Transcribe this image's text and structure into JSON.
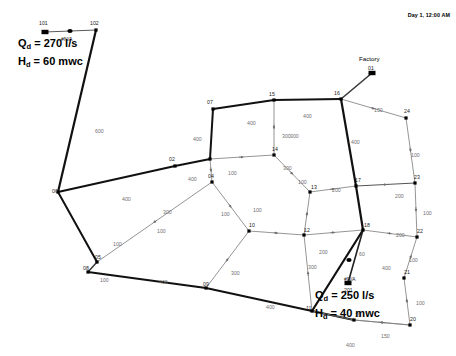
{
  "window": {
    "title": "Water Distribution Network Map",
    "background": "#ffffff"
  },
  "header": {
    "timestamp": "Day 1, 12:00 AM"
  },
  "annotations": {
    "source": {
      "flow_label": "Q",
      "flow_sub": "d",
      "flow_value": " = 270 l/s",
      "head_label": "H",
      "head_sub": "d",
      "head_value": " = 60 mwc",
      "na": "#N/A"
    },
    "factory": {
      "title": "Factory",
      "flow_label": "Q",
      "flow_sub": "d",
      "flow_value": " = 250 l/s",
      "head_label": "H",
      "head_sub": "d",
      "head_value": " = 40 mwc",
      "na": "#N/A",
      "pump_id": "201"
    }
  },
  "colors": {
    "pipe_thin": "#595959",
    "pipe_thick": "#111111",
    "node": "#000000",
    "length_text": "#6f6f6f",
    "node_text": "#1a1a1a"
  },
  "chart_data": {
    "type": "diagram",
    "nodes": [
      {
        "id": "101",
        "label": "101",
        "x": 45,
        "y": 32,
        "kind": "reservoir"
      },
      {
        "id": "102",
        "label": "102",
        "x": 96,
        "y": 30,
        "kind": "junction"
      },
      {
        "id": "v100",
        "label": "#N/A",
        "x": 70,
        "y": 31,
        "kind": "pump"
      },
      {
        "id": "06",
        "label": "06",
        "x": 58,
        "y": 192,
        "kind": "junction"
      },
      {
        "id": "02",
        "label": "02",
        "x": 175,
        "y": 166,
        "kind": "junction"
      },
      {
        "id": "03",
        "label": "03",
        "x": 210,
        "y": 159,
        "kind": "junction"
      },
      {
        "id": "07",
        "label": "07",
        "x": 213,
        "y": 109,
        "kind": "junction"
      },
      {
        "id": "15",
        "label": "15",
        "x": 274,
        "y": 100,
        "kind": "junction"
      },
      {
        "id": "16",
        "label": "16",
        "x": 341,
        "y": 99,
        "kind": "junction"
      },
      {
        "id": "01",
        "label": "01",
        "x": 372,
        "y": 73,
        "kind": "reservoir"
      },
      {
        "id": "24",
        "label": "24",
        "x": 406,
        "y": 118,
        "kind": "junction"
      },
      {
        "id": "23",
        "label": "23",
        "x": 415,
        "y": 183,
        "kind": "junction"
      },
      {
        "id": "22",
        "label": "22",
        "x": 417,
        "y": 237,
        "kind": "junction"
      },
      {
        "id": "21",
        "label": "21",
        "x": 404,
        "y": 278,
        "kind": "junction"
      },
      {
        "id": "20",
        "label": "20",
        "x": 410,
        "y": 325,
        "kind": "junction"
      },
      {
        "id": "19",
        "label": "19",
        "x": 354,
        "y": 320,
        "kind": "junction"
      },
      {
        "id": "17",
        "label": "17",
        "x": 356,
        "y": 186,
        "kind": "junction"
      },
      {
        "id": "18",
        "label": "18",
        "x": 363,
        "y": 230,
        "kind": "junction"
      },
      {
        "id": "04",
        "label": "04",
        "x": 212,
        "y": 182,
        "kind": "junction"
      },
      {
        "id": "14",
        "label": "14",
        "x": 274,
        "y": 155,
        "kind": "junction"
      },
      {
        "id": "13",
        "label": "13",
        "x": 310,
        "y": 192,
        "kind": "junction"
      },
      {
        "id": "12",
        "label": "12",
        "x": 304,
        "y": 235,
        "kind": "junction"
      },
      {
        "id": "10",
        "label": "10",
        "x": 249,
        "y": 231,
        "kind": "junction"
      },
      {
        "id": "05",
        "label": "05",
        "x": 97,
        "y": 262,
        "kind": "junction"
      },
      {
        "id": "08",
        "label": "08",
        "x": 88,
        "y": 272,
        "kind": "junction"
      },
      {
        "id": "09",
        "label": "09",
        "x": 206,
        "y": 288,
        "kind": "junction"
      },
      {
        "id": "11",
        "label": "11",
        "x": 312,
        "y": 311,
        "kind": "junction"
      },
      {
        "id": "202",
        "label": "#N/A",
        "x": 349,
        "y": 260,
        "kind": "pump"
      },
      {
        "id": "201",
        "label": "201",
        "x": 348,
        "y": 283,
        "kind": "reservoir"
      }
    ],
    "pipes": [
      {
        "from": "101",
        "to": "102",
        "length": "",
        "width": 1,
        "color": "#595959"
      },
      {
        "from": "102",
        "to": "06",
        "length": "600",
        "width": 2.2,
        "color": "#111111"
      },
      {
        "from": "06",
        "to": "02",
        "length": "400",
        "width": 2.2,
        "color": "#111111"
      },
      {
        "from": "02",
        "to": "03",
        "length": "400",
        "width": 2.2,
        "color": "#111111"
      },
      {
        "from": "03",
        "to": "07",
        "length": "400",
        "width": 2.0,
        "color": "#111111"
      },
      {
        "from": "07",
        "to": "15",
        "length": "400",
        "width": 2.0,
        "color": "#111111"
      },
      {
        "from": "15",
        "to": "16",
        "length": "400",
        "width": 2.0,
        "color": "#111111"
      },
      {
        "from": "16",
        "to": "01",
        "length": "300",
        "width": 1.6,
        "color": "#3a3a3a"
      },
      {
        "from": "16",
        "to": "24",
        "length": "150",
        "width": 0.8,
        "color": "#7a7a7a"
      },
      {
        "from": "24",
        "to": "23",
        "length": "100",
        "width": 0.8,
        "color": "#7a7a7a"
      },
      {
        "from": "23",
        "to": "22",
        "length": "100",
        "width": 0.8,
        "color": "#7a7a7a"
      },
      {
        "from": "22",
        "to": "21",
        "length": "100",
        "width": 0.8,
        "color": "#7a7a7a"
      },
      {
        "from": "21",
        "to": "20",
        "length": "100",
        "width": 0.8,
        "color": "#7a7a7a"
      },
      {
        "from": "20",
        "to": "19",
        "length": "150",
        "width": 0.8,
        "color": "#7a7a7a"
      },
      {
        "from": "16",
        "to": "17",
        "length": "400",
        "width": 2.2,
        "color": "#111111"
      },
      {
        "from": "17",
        "to": "23",
        "length": "200",
        "width": 1.1,
        "color": "#555555"
      },
      {
        "from": "17",
        "to": "18",
        "length": "400",
        "width": 2.2,
        "color": "#111111"
      },
      {
        "from": "18",
        "to": "22",
        "length": "200",
        "width": 0.8,
        "color": "#7a7a7a"
      },
      {
        "from": "18",
        "to": "11",
        "length": "400",
        "width": 2.2,
        "color": "#111111"
      },
      {
        "from": "11",
        "to": "19",
        "length": "",
        "width": 2.2,
        "color": "#111111"
      },
      {
        "from": "19",
        "to": "09x",
        "length": "400",
        "width": 0.8,
        "color": "#7a7a7a"
      },
      {
        "from": "13",
        "to": "17",
        "length": "200",
        "width": 0.8,
        "color": "#7a7a7a"
      },
      {
        "from": "12",
        "to": "18",
        "length": "200",
        "width": 0.8,
        "color": "#7a7a7a"
      },
      {
        "from": "12",
        "to": "13",
        "length": "100",
        "width": 0.8,
        "color": "#7a7a7a"
      },
      {
        "from": "14",
        "to": "13",
        "length": "100",
        "width": 0.8,
        "color": "#7a7a7a"
      },
      {
        "from": "15",
        "to": "14",
        "length": "300",
        "width": 0.8,
        "color": "#7a7a7a"
      },
      {
        "from": "03",
        "to": "14",
        "length": "100",
        "width": 0.8,
        "color": "#7a7a7a"
      },
      {
        "from": "03",
        "to": "04",
        "length": "100",
        "width": 0.8,
        "color": "#7a7a7a"
      },
      {
        "from": "04",
        "to": "10",
        "length": "100",
        "width": 0.8,
        "color": "#7a7a7a"
      },
      {
        "from": "10",
        "to": "12",
        "length": "100",
        "width": 0.8,
        "color": "#7a7a7a"
      },
      {
        "from": "04",
        "to": "05",
        "length": "300",
        "width": 0.8,
        "color": "#7a7a7a"
      },
      {
        "from": "06",
        "to": "05",
        "length": "100",
        "width": 2.0,
        "color": "#111111"
      },
      {
        "from": "05",
        "to": "08",
        "length": "",
        "width": 1.4,
        "color": "#333333"
      },
      {
        "from": "08",
        "to": "09",
        "length": "400",
        "width": 2.2,
        "color": "#111111"
      },
      {
        "from": "09",
        "to": "11",
        "length": "400",
        "width": 2.2,
        "color": "#111111"
      },
      {
        "from": "09",
        "to": "10",
        "length": "300",
        "width": 0.8,
        "color": "#7a7a7a"
      },
      {
        "from": "11",
        "to": "12",
        "length": "300",
        "width": 0.8,
        "color": "#7a7a7a"
      },
      {
        "from": "201",
        "to": "18",
        "length": "60",
        "width": 1.6,
        "color": "#222222"
      },
      {
        "from": "19",
        "to": "20b",
        "length": "150",
        "width": 0.8,
        "color": "#7a7a7a"
      }
    ],
    "pipe_length_labels": [
      {
        "text": "600",
        "x": 95,
        "y": 128
      },
      {
        "text": "400",
        "x": 122,
        "y": 196
      },
      {
        "text": "400",
        "x": 188,
        "y": 176
      },
      {
        "text": "400",
        "x": 193,
        "y": 136
      },
      {
        "text": "400",
        "x": 247,
        "y": 120
      },
      {
        "text": "400",
        "x": 303,
        "y": 113
      },
      {
        "text": "300",
        "x": 290,
        "y": 133
      },
      {
        "text": "150",
        "x": 374,
        "y": 107
      },
      {
        "text": "100",
        "x": 411,
        "y": 152
      },
      {
        "text": "100",
        "x": 423,
        "y": 210
      },
      {
        "text": "100",
        "x": 409,
        "y": 257
      },
      {
        "text": "100",
        "x": 416,
        "y": 300
      },
      {
        "text": "150",
        "x": 381,
        "y": 333
      },
      {
        "text": "400",
        "x": 351,
        "y": 139
      },
      {
        "text": "200",
        "x": 395,
        "y": 193
      },
      {
        "text": "400",
        "x": 382,
        "y": 265
      },
      {
        "text": "200",
        "x": 396,
        "y": 232
      },
      {
        "text": "400",
        "x": 346,
        "y": 342
      },
      {
        "text": "300",
        "x": 282,
        "y": 133
      },
      {
        "text": "300",
        "x": 283,
        "y": 165
      },
      {
        "text": "200",
        "x": 332,
        "y": 187
      },
      {
        "text": "200",
        "x": 319,
        "y": 249
      },
      {
        "text": "100",
        "x": 298,
        "y": 179
      },
      {
        "text": "100",
        "x": 253,
        "y": 207
      },
      {
        "text": "100",
        "x": 228,
        "y": 170
      },
      {
        "text": "100",
        "x": 221,
        "y": 211
      },
      {
        "text": "100",
        "x": 157,
        "y": 228
      },
      {
        "text": "300",
        "x": 163,
        "y": 209
      },
      {
        "text": "300",
        "x": 231,
        "y": 270
      },
      {
        "text": "400",
        "x": 159,
        "y": 279
      },
      {
        "text": "400",
        "x": 266,
        "y": 304
      },
      {
        "text": "300",
        "x": 308,
        "y": 264
      },
      {
        "text": "100",
        "x": 113,
        "y": 241
      },
      {
        "text": "100",
        "x": 100,
        "y": 277
      },
      {
        "text": "60",
        "y": 251,
        "x": 359
      }
    ],
    "node_labels": [
      {
        "text": "101",
        "x": 39,
        "y": 20
      },
      {
        "text": "102",
        "x": 90,
        "y": 20
      },
      {
        "text": "07",
        "x": 207,
        "y": 99
      },
      {
        "text": "15",
        "x": 269,
        "y": 91
      },
      {
        "text": "16",
        "x": 334,
        "y": 90
      },
      {
        "text": "01",
        "x": 368,
        "y": 65
      },
      {
        "text": "24",
        "x": 404,
        "y": 108
      },
      {
        "text": "23",
        "x": 414,
        "y": 174
      },
      {
        "text": "22",
        "x": 417,
        "y": 228
      },
      {
        "text": "21",
        "x": 404,
        "y": 269
      },
      {
        "text": "20",
        "x": 410,
        "y": 316
      },
      {
        "text": "19",
        "x": 355,
        "y": 312
      },
      {
        "text": "17",
        "x": 355,
        "y": 177
      },
      {
        "text": "18",
        "x": 364,
        "y": 222
      },
      {
        "text": "02",
        "x": 169,
        "y": 156
      },
      {
        "text": "04",
        "x": 208,
        "y": 173
      },
      {
        "text": "14",
        "x": 272,
        "y": 146
      },
      {
        "text": "13",
        "x": 311,
        "y": 184
      },
      {
        "text": "12",
        "x": 304,
        "y": 227
      },
      {
        "text": "10",
        "x": 249,
        "y": 222
      },
      {
        "text": "06",
        "x": 52,
        "y": 188
      },
      {
        "text": "05",
        "x": 95,
        "y": 254
      },
      {
        "text": "08",
        "x": 83,
        "y": 265
      },
      {
        "text": "09",
        "x": 203,
        "y": 281
      },
      {
        "text": "11",
        "x": 306,
        "y": 305
      },
      {
        "text": "201",
        "x": 344,
        "y": 287
      },
      {
        "text": "#N/A",
        "x": 344,
        "y": 276
      }
    ]
  }
}
